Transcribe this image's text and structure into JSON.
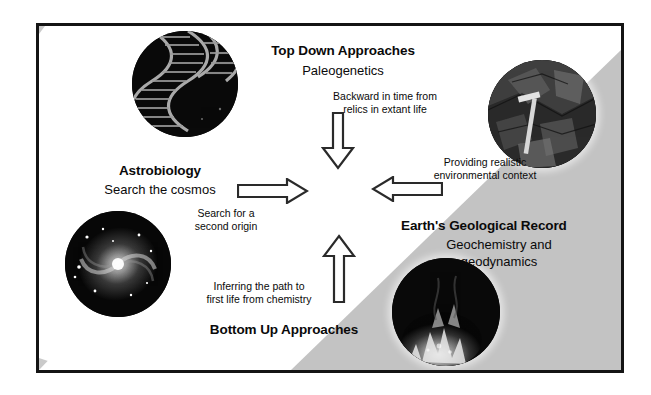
{
  "figure": {
    "background_color": "#ffffff",
    "frame_color": "#141414",
    "wedge_color": "#c9c9c9"
  },
  "nodes": {
    "top": {
      "title": "Top Down Approaches",
      "subtitle": "Paleogenetics",
      "image_name": "dna-double-helix-image"
    },
    "left": {
      "title": "Astrobiology",
      "subtitle": "Search the cosmos",
      "image_name": "spiral-galaxy-image"
    },
    "right": {
      "title": "Earth's Geological Record",
      "subtitle_line1": "Geochemistry and",
      "subtitle_line2": "geodynamics",
      "image_name": "rock-outcrop-image"
    },
    "bottom": {
      "title": "Bottom Up Approaches",
      "image_name": "hydrothermal-vent-image"
    }
  },
  "arrows": {
    "down": {
      "direction": "down",
      "caption_line1": "Backward in time from",
      "caption_line2": "relics in extant life"
    },
    "up": {
      "direction": "up",
      "caption_line1": "Inferring the path to",
      "caption_line2": "first life from chemistry"
    },
    "right": {
      "direction": "right",
      "caption_line1": "Search for a",
      "caption_line2": "second origin"
    },
    "left": {
      "direction": "left",
      "caption_line1": "Providing realistic",
      "caption_line2": "environmental context"
    }
  }
}
